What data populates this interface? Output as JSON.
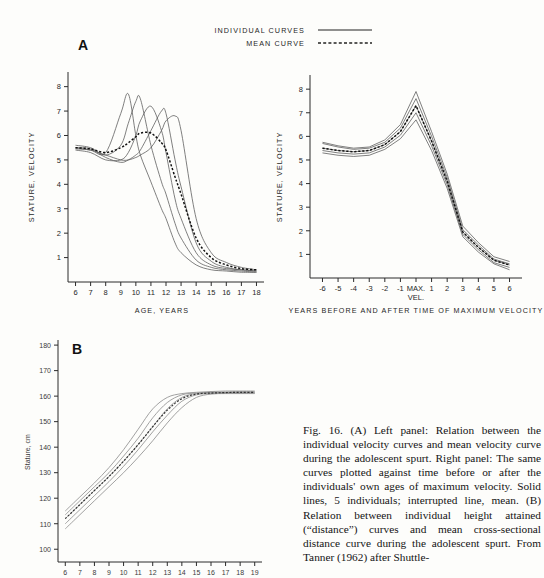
{
  "figure": {
    "panel_a_letter": "A",
    "panel_b_letter": "B",
    "legend": {
      "individual_label": "INDIVIDUAL CURVES",
      "mean_label": "MEAN CURVE"
    },
    "caption": "Fig. 16. (A) Left panel: Relation between the individual velocity curves and mean velocity curve during the adolescent spurt. Right panel: The same curves plotted against time before or after the individuals' own ages of maximum velocity. Solid lines, 5 individuals; interrupted line, mean. (B) Relation between individual height attained (“distance”) curves and mean cross-sectional distance curve during the adolescent spurt. From Tanner (1962) after Shuttle-"
  },
  "chart_data": [
    {
      "id": "panel-a-left",
      "type": "line",
      "title": "A",
      "xlabel": "AGE, YEARS",
      "ylabel": "STATURE, VELOCITY",
      "xlim": [
        5.5,
        18.5
      ],
      "ylim": [
        0,
        8.6
      ],
      "xticks": [
        6,
        7,
        8,
        9,
        10,
        11,
        12,
        13,
        14,
        15,
        16,
        17,
        18
      ],
      "yticks": [
        1,
        2,
        3,
        4,
        5,
        6,
        7,
        8
      ],
      "grid": false,
      "legend_position": "top-right",
      "x": [
        6,
        7,
        8,
        9,
        9.5,
        10,
        10.3,
        11,
        11.7,
        12,
        12.6,
        13,
        14,
        15,
        16,
        17,
        18
      ],
      "series": [
        {
          "name": "Individual 1",
          "style": "solid",
          "values": [
            5.5,
            5.4,
            5.3,
            6.9,
            7.7,
            6.0,
            5.2,
            4.1,
            3.0,
            2.6,
            1.6,
            1.2,
            0.7,
            0.5,
            0.45,
            0.4,
            0.4
          ]
        },
        {
          "name": "Individual 2",
          "style": "solid",
          "values": [
            5.6,
            5.5,
            5.2,
            5.6,
            6.5,
            7.4,
            7.5,
            5.6,
            4.1,
            3.6,
            2.4,
            1.8,
            0.9,
            0.6,
            0.5,
            0.45,
            0.4
          ]
        },
        {
          "name": "Individual 3",
          "style": "solid",
          "values": [
            5.4,
            5.3,
            5.0,
            5.0,
            5.3,
            6.0,
            6.6,
            7.2,
            6.2,
            5.3,
            3.4,
            2.6,
            1.2,
            0.7,
            0.55,
            0.5,
            0.45
          ]
        },
        {
          "name": "Individual 4",
          "style": "solid",
          "values": [
            5.5,
            5.45,
            5.1,
            4.9,
            5.0,
            5.2,
            5.4,
            6.2,
            7.0,
            6.9,
            5.0,
            3.9,
            1.6,
            0.85,
            0.6,
            0.5,
            0.45
          ]
        },
        {
          "name": "Individual 5",
          "style": "solid",
          "values": [
            5.45,
            5.4,
            5.2,
            5.0,
            5.0,
            5.1,
            5.2,
            5.5,
            6.2,
            6.6,
            6.8,
            6.2,
            2.6,
            1.2,
            0.8,
            0.6,
            0.5
          ]
        },
        {
          "name": "Mean curve",
          "style": "dashed",
          "values": [
            5.5,
            5.45,
            5.3,
            5.5,
            5.7,
            5.95,
            6.1,
            6.1,
            5.7,
            5.4,
            4.3,
            3.6,
            1.8,
            1.0,
            0.7,
            0.55,
            0.5
          ]
        }
      ]
    },
    {
      "id": "panel-a-right",
      "type": "line",
      "xlabel": "YEARS BEFORE AND AFTER TIME OF MAXIMUM VELOCITY",
      "ylabel": "STATURE, VELOCITY",
      "xlim": [
        -6.8,
        6.8
      ],
      "ylim": [
        0,
        8.6
      ],
      "xticks": [
        -6,
        -5,
        -4,
        -3,
        -2,
        -1,
        0,
        1,
        2,
        3,
        4,
        5,
        6
      ],
      "xticklabels": [
        "-6",
        "-5",
        "-4",
        "-3",
        "-2",
        "-1",
        "MAX. VEL.",
        "1",
        "2",
        "3",
        "4",
        "5",
        "6"
      ],
      "yticks": [
        1,
        2,
        3,
        4,
        5,
        6,
        7,
        8
      ],
      "grid": false,
      "x": [
        -6,
        -5,
        -4,
        -3,
        -2,
        -1,
        0,
        1,
        2,
        3,
        4,
        5,
        6
      ],
      "series": [
        {
          "name": "Individual 1",
          "style": "solid",
          "values": [
            5.75,
            5.6,
            5.5,
            5.55,
            5.85,
            6.5,
            7.9,
            6.2,
            4.4,
            2.2,
            1.5,
            0.9,
            0.7
          ]
        },
        {
          "name": "Individual 2",
          "style": "solid",
          "values": [
            5.7,
            5.55,
            5.45,
            5.5,
            5.75,
            6.35,
            7.6,
            6.0,
            4.25,
            2.05,
            1.4,
            0.8,
            0.6
          ]
        },
        {
          "name": "Individual 3",
          "style": "solid",
          "values": [
            5.5,
            5.4,
            5.35,
            5.4,
            5.65,
            6.2,
            7.3,
            5.8,
            4.1,
            1.95,
            1.3,
            0.75,
            0.55
          ]
        },
        {
          "name": "Individual 4",
          "style": "solid",
          "values": [
            5.4,
            5.3,
            5.25,
            5.3,
            5.55,
            6.05,
            7.0,
            5.6,
            3.95,
            1.85,
            1.2,
            0.65,
            0.45
          ]
        },
        {
          "name": "Individual 5",
          "style": "solid",
          "values": [
            5.3,
            5.2,
            5.15,
            5.2,
            5.45,
            5.9,
            6.7,
            5.4,
            3.8,
            1.75,
            1.1,
            0.6,
            0.35
          ]
        },
        {
          "name": "Mean curve",
          "style": "dashed",
          "values": [
            5.5,
            5.4,
            5.35,
            5.4,
            5.65,
            6.2,
            7.3,
            5.8,
            4.1,
            1.95,
            1.3,
            0.75,
            0.55
          ]
        }
      ]
    },
    {
      "id": "panel-b",
      "type": "line",
      "title": "B",
      "xlabel": "",
      "ylabel": "Stature, cm",
      "xlim": [
        5.5,
        19.5
      ],
      "ylim": [
        95,
        182
      ],
      "xticks": [
        6,
        7,
        8,
        9,
        10,
        11,
        12,
        13,
        14,
        15,
        16,
        17,
        18,
        19
      ],
      "yticks": [
        100,
        110,
        120,
        130,
        140,
        150,
        160,
        170,
        180
      ],
      "grid": false,
      "x": [
        6,
        7,
        8,
        9,
        10,
        11,
        12,
        13,
        14,
        15,
        16,
        17,
        18,
        19
      ],
      "series": [
        {
          "name": "Individual 1",
          "style": "solid",
          "values": [
            115.0,
            120.5,
            126.0,
            132.0,
            139.0,
            147.0,
            155.0,
            159.5,
            161.0,
            161.5,
            161.8,
            162.0,
            162.0,
            162.0
          ]
        },
        {
          "name": "Individual 2",
          "style": "solid",
          "values": [
            113.5,
            119.0,
            124.5,
            130.0,
            136.5,
            143.5,
            151.5,
            157.5,
            160.5,
            161.2,
            161.5,
            161.6,
            161.7,
            161.7
          ]
        },
        {
          "name": "Individual 3",
          "style": "solid",
          "values": [
            112.0,
            117.5,
            123.0,
            128.5,
            134.5,
            141.0,
            148.0,
            155.0,
            159.5,
            161.0,
            161.3,
            161.4,
            161.5,
            161.5
          ]
        },
        {
          "name": "Individual 4",
          "style": "solid",
          "values": [
            110.0,
            115.5,
            121.0,
            126.5,
            132.5,
            139.0,
            146.0,
            152.5,
            158.0,
            160.5,
            161.0,
            161.2,
            161.2,
            161.2
          ]
        },
        {
          "name": "Individual 5",
          "style": "solid",
          "values": [
            108.0,
            113.5,
            119.0,
            124.5,
            130.0,
            136.0,
            142.5,
            149.5,
            155.5,
            159.5,
            160.8,
            161.0,
            161.0,
            161.0
          ]
        },
        {
          "name": "Mean curve",
          "style": "dashed",
          "values": [
            112.0,
            117.5,
            123.0,
            128.5,
            134.5,
            141.0,
            148.0,
            154.5,
            159.0,
            160.8,
            161.2,
            161.4,
            161.5,
            161.5
          ]
        }
      ]
    }
  ]
}
